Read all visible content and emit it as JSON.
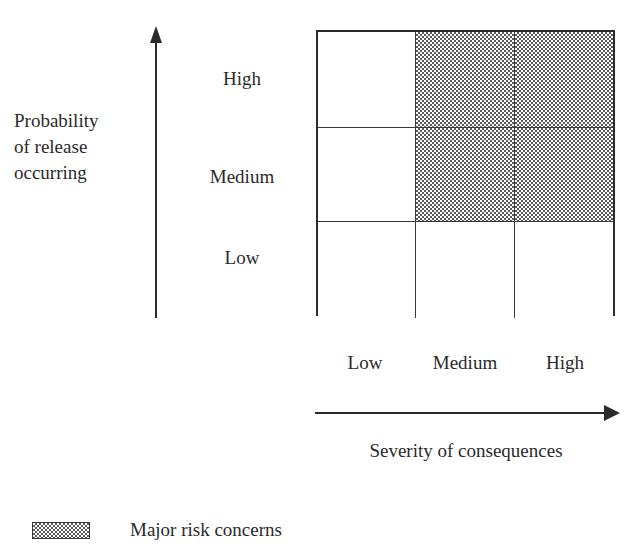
{
  "chart_data": {
    "type": "heatmap",
    "title": "",
    "xlabel": "Severity of consequences",
    "ylabel": "Probability of release occurring",
    "x_categories": [
      "Low",
      "Medium",
      "High"
    ],
    "y_categories": [
      "High",
      "Medium",
      "Low"
    ],
    "grid": true,
    "legend_position": "bottom-left",
    "cells": [
      {
        "y": "High",
        "x": "Low",
        "shaded": false,
        "risk": "not major"
      },
      {
        "y": "High",
        "x": "Medium",
        "shaded": true,
        "risk": "Major risk concerns"
      },
      {
        "y": "High",
        "x": "High",
        "shaded": true,
        "risk": "Major risk concerns"
      },
      {
        "y": "Medium",
        "x": "Low",
        "shaded": false,
        "risk": "not major"
      },
      {
        "y": "Medium",
        "x": "Medium",
        "shaded": true,
        "risk": "Major risk concerns"
      },
      {
        "y": "Medium",
        "x": "High",
        "shaded": true,
        "risk": "Major risk concerns"
      },
      {
        "y": "Low",
        "x": "Low",
        "shaded": false,
        "risk": "not major"
      },
      {
        "y": "Low",
        "x": "Medium",
        "shaded": false,
        "risk": "not major"
      },
      {
        "y": "Low",
        "x": "High",
        "shaded": false,
        "risk": "not major"
      }
    ],
    "legend": [
      {
        "label": "Major risk concerns",
        "pattern": "checkerboard-hatch"
      }
    ]
  },
  "axes": {
    "y": {
      "title_lines": [
        "Probability",
        "of release",
        "occurring"
      ],
      "ticks": {
        "high": "High",
        "medium": "Medium",
        "low": "Low"
      },
      "arrow_direction": "up"
    },
    "x": {
      "title": "Severity of consequences",
      "ticks": {
        "low": "Low",
        "medium": "Medium",
        "high": "High"
      },
      "arrow_direction": "right"
    }
  },
  "legend": {
    "items": [
      {
        "label": "Major risk concerns"
      }
    ]
  },
  "colors": {
    "ink": "#2b2b2b",
    "rule": "#3a3a3a",
    "shade": "#5a5a5a",
    "background": "#ffffff"
  }
}
